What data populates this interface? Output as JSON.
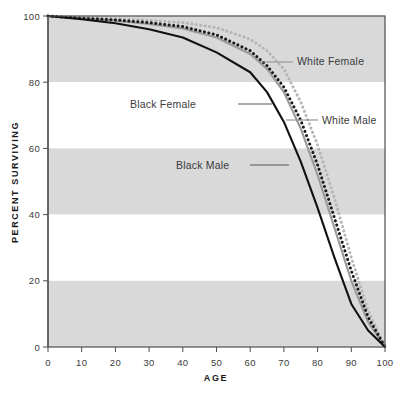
{
  "chart_data": {
    "type": "line",
    "title": "",
    "xlabel": "AGE",
    "ylabel": "PERCENT SURVIVING",
    "xlim": [
      0,
      100
    ],
    "ylim": [
      0,
      100
    ],
    "xticks": [
      "0",
      "10",
      "20",
      "30",
      "40",
      "50",
      "60",
      "70",
      "80",
      "90",
      "100"
    ],
    "yticks": [
      "0",
      "20",
      "40",
      "60",
      "80",
      "100"
    ],
    "grid": false,
    "banding": "alternating gray bands at 0-20, 40-60, 80-100",
    "legend_position": "inline-annotations-with-leader-lines",
    "x": [
      0,
      10,
      20,
      30,
      40,
      50,
      60,
      65,
      70,
      75,
      80,
      85,
      90,
      95,
      100
    ],
    "series": [
      {
        "name": "White Female",
        "style": "dotted",
        "color": "#b5b5b5",
        "values": [
          100,
          99.5,
          99.2,
          98.7,
          98.0,
          96.5,
          93.0,
          89.5,
          84.0,
          74.0,
          61.0,
          45.0,
          27.0,
          11.0,
          0
        ]
      },
      {
        "name": "White Male",
        "style": "solid",
        "color": "#9a9a9a",
        "values": [
          100,
          99.3,
          98.6,
          97.6,
          96.2,
          93.5,
          88.5,
          84.0,
          77.0,
          66.0,
          52.0,
          36.0,
          20.0,
          7.5,
          0
        ]
      },
      {
        "name": "Black Female",
        "style": "dotted",
        "color": "#1a1a1a",
        "values": [
          100,
          99.3,
          98.8,
          98.0,
          96.8,
          94.3,
          89.5,
          85.0,
          78.5,
          68.5,
          55.0,
          39.0,
          23.0,
          9.0,
          0
        ]
      },
      {
        "name": "Black Male",
        "style": "solid",
        "color": "#111111",
        "values": [
          100,
          99.0,
          97.8,
          96.0,
          93.5,
          89.0,
          83.0,
          77.0,
          68.0,
          56.0,
          42.0,
          27.0,
          13.0,
          5.0,
          0
        ]
      }
    ],
    "annotations": [
      {
        "label": "White Female",
        "series": "White Female",
        "text_x": 297,
        "text_y": 65,
        "leader_from_x": 259,
        "leader_to_x": 293,
        "leader_y": 62
      },
      {
        "label": "Black Female",
        "series": "Black Female",
        "text_x": 130,
        "text_y": 108,
        "leader_from_x": 238,
        "leader_to_x": 272,
        "leader_y": 104
      },
      {
        "label": "White Male",
        "series": "White Male",
        "text_x": 322,
        "text_y": 124,
        "leader_from_x": 286,
        "leader_to_x": 318,
        "leader_y": 120
      },
      {
        "label": "Black Male",
        "series": "Black Male",
        "text_x": 176,
        "text_y": 169,
        "leader_from_x": 250,
        "leader_to_x": 289,
        "leader_y": 165
      }
    ],
    "colors": {
      "band_gray": "#d9d9d9",
      "band_white": "#ffffff",
      "frame": "#4d4d4d",
      "text": "#3b3b3b",
      "background": "#ffffff"
    }
  }
}
